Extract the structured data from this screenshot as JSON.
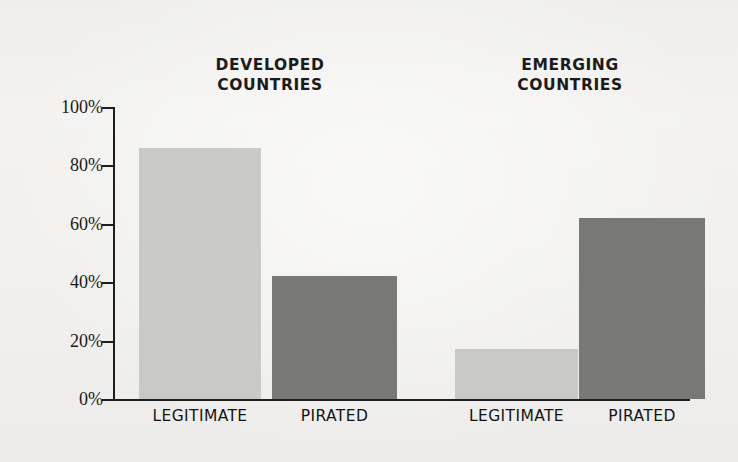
{
  "chart_data": {
    "type": "bar",
    "title": "",
    "subtitle": "",
    "xlabel": "",
    "ylabel": "",
    "ylim": [
      0,
      100
    ],
    "y_unit": "%",
    "grid": false,
    "legend_position": "none",
    "group_headings": [
      {
        "line1": "DEVELOPED",
        "line2": "COUNTRIES"
      },
      {
        "line1": "EMERGING",
        "line2": "COUNTRIES"
      }
    ],
    "categories": [
      "LEGITIMATE",
      "PIRATED",
      "LEGITIMATE",
      "PIRATED"
    ],
    "values": [
      86,
      42,
      17,
      62
    ],
    "bars": [
      {
        "group": "DEVELOPED COUNTRIES",
        "category": "LEGITIMATE",
        "value": 86,
        "color": "#c9c9c7",
        "shade": "light"
      },
      {
        "group": "DEVELOPED COUNTRIES",
        "category": "PIRATED",
        "value": 42,
        "color": "#787876",
        "shade": "dark"
      },
      {
        "group": "EMERGING COUNTRIES",
        "category": "LEGITIMATE",
        "value": 17,
        "color": "#c9c9c7",
        "shade": "light"
      },
      {
        "group": "EMERGING COUNTRIES",
        "category": "PIRATED",
        "value": 62,
        "color": "#787876",
        "shade": "dark"
      }
    ],
    "y_ticks": [
      "100%",
      "80%",
      "60%",
      "40%",
      "20%",
      "0%"
    ],
    "y_tick_values": [
      100,
      80,
      60,
      40,
      20,
      0
    ],
    "colors": {
      "light_bar": "#c9c9c7",
      "dark_bar": "#787876",
      "axis": "#1e1e1e",
      "text": "#141414",
      "background": "#f2f1ef"
    }
  }
}
